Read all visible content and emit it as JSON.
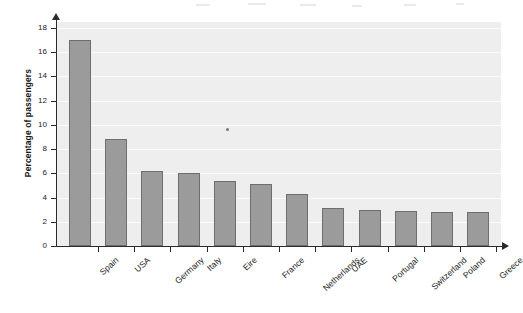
{
  "chart_data": {
    "type": "bar",
    "title": "",
    "subtitle": "",
    "xlabel": "",
    "ylabel": "Percentage of passengers",
    "categories": [
      "Spain",
      "USA",
      "Germany",
      "Italy",
      "Eire",
      "France",
      "Netherlands",
      "UAE",
      "Portugal",
      "Switzerland",
      "Poland",
      "Greece"
    ],
    "values": [
      17.0,
      8.8,
      6.2,
      6.0,
      5.4,
      5.1,
      4.3,
      3.1,
      3.0,
      2.9,
      2.8,
      2.8
    ],
    "ylim": [
      0,
      18
    ],
    "ytick_labels": [
      "0",
      "2",
      "4",
      "6",
      "8",
      "10",
      "12",
      "14",
      "16",
      "18"
    ],
    "ytick_values": [
      0,
      2,
      4,
      6,
      8,
      10,
      12,
      14,
      16,
      18
    ],
    "grid": true,
    "legend": "none",
    "bar_color": "#9b9b9b",
    "bar_edge_color": "#6e6e6e",
    "plot_background": "#eeeeee",
    "axis_color": "#2b2b2b",
    "gridline_color": "#fbfbfb"
  }
}
